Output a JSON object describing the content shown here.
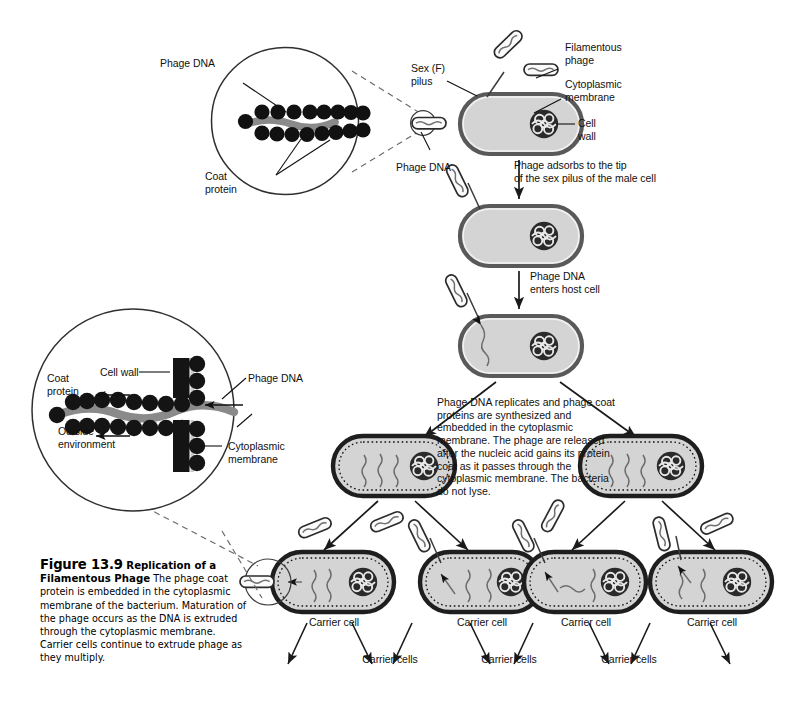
{
  "figure": {
    "number": "Figure 13.9",
    "title": "Replication of a Filamentous Phage",
    "body": "The phage coat protein is embedded in the cytoplasmic membrane of the bacterium. Maturation of the phage occurs as the DNA is extruded through the cytoplasmic membrane. Carrier cells continue to extrude phage as they multiply.",
    "caption_full": "Figure 13.9 Replication of a Filamentous Phage The phage coat protein is embedded in the cytoplasmic membrane of the bacterium. Maturation of the phage occurs as the DNA is extruded through the cytoplasmic membrane. Carrier cells continue to extrude phage as they multiply."
  },
  "inset_top": {
    "label_phage_dna": "Phage DNA",
    "label_coat_protein": "Coat\nprotein",
    "label_phage_dna_outer": "Phage DNA",
    "coat_protein_pairs": 8,
    "description": "Enlarged filamentous phage particle: two rows of coat protein subunits enclosing a single strand of phage DNA"
  },
  "inset_bottom": {
    "label_coat_protein": "Coat\nprotein",
    "label_cell_wall": "Cell wall",
    "label_phage_dna": "Phage DNA",
    "label_cytoplasmic_membrane": "Cytoplasmic\nmembrane",
    "label_outside_environment": "Outside\nenvironment",
    "description": "Enlarged view of phage extrusion: DNA passes through the cytoplasmic membrane and gains its coat protein as it exits into the outside environment"
  },
  "cell_labels": {
    "sex_pilus": "Sex (F)\npilus",
    "filamentous_phage": "Filamentous\nphage",
    "cytoplasmic_membrane": "Cytoplasmic\nmembrane",
    "cell_wall": "Cell\nwall"
  },
  "steps": [
    {
      "id": "step-1",
      "text": "Phage adsorbs to the tip\nof the sex pilus of the male cell"
    },
    {
      "id": "step-2",
      "text": "Phage DNA\nenters host cell"
    },
    {
      "id": "step-3",
      "text": "Phage DNA replicates and phage coat proteins are synthesized and embedded in the cytoplasmic membrane. The phage are released after the nucleic acid gains its protein coat as it passes through the cytoplasmic membrane. The bacteria do not lyse."
    }
  ],
  "carrier_cells": {
    "singular_label": "Carrier cell",
    "plural_label": "Carrier cells",
    "singular_count": 4,
    "plural_count": 3
  },
  "colors": {
    "cytoplasm": "#d4d4d4",
    "membrane_outline": "#6e6e6e",
    "wall_dark": "#1c1c1c",
    "dna_gray": "#8a8a8a",
    "line": "#1a1a1a",
    "background": "#ffffff"
  }
}
